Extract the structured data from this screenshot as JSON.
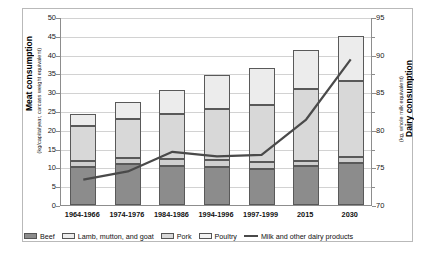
{
  "axes": {
    "left": {
      "title": "Meat consumption",
      "subtitle": "(kg/capita/year, carcass weight equivalent)",
      "ticks": [
        "0",
        "5",
        "10",
        "15",
        "20",
        "25",
        "30",
        "35",
        "40",
        "45",
        "50"
      ],
      "min": 0,
      "max": 50
    },
    "right": {
      "title": "Dairy consumption",
      "subtitle": "(kg, whole milk equivalent)",
      "ticks": [
        "70",
        "75",
        "80",
        "85",
        "90",
        "95"
      ],
      "min": 70,
      "max": 95
    }
  },
  "legend": {
    "items": [
      {
        "label": "Beef",
        "key": "beef",
        "marker": "swatch"
      },
      {
        "label": "Lamb, mutton, and goat",
        "key": "lamb",
        "marker": "swatch"
      },
      {
        "label": "Pork",
        "key": "pork",
        "marker": "swatch"
      },
      {
        "label": "Poultry",
        "key": "poultry",
        "marker": "swatch"
      },
      {
        "label": "Milk and other dairy products",
        "key": "milk",
        "marker": "line"
      }
    ]
  },
  "chart_data": {
    "type": "bar",
    "title": "",
    "xlabel": "",
    "ylabel": "Meat consumption (kg/capita/year, carcass weight equivalent)",
    "y2label": "Dairy consumption (kg, whole milk equivalent)",
    "ylim": [
      0,
      50
    ],
    "y2lim": [
      70,
      95
    ],
    "grid": true,
    "legend_position": "bottom",
    "stacked": true,
    "categories": [
      "1964-1966",
      "1974-1976",
      "1984-1986",
      "1994-1996",
      "1997-1999",
      "2015",
      "2030"
    ],
    "series": [
      {
        "name": "Beef",
        "axis": "left",
        "type": "bar",
        "values": [
          10.2,
          11.0,
          10.5,
          10.0,
          9.7,
          10.3,
          11.2
        ]
      },
      {
        "name": "Poultry",
        "axis": "left",
        "type": "bar",
        "values": [
          1.6,
          1.6,
          1.7,
          2.0,
          1.8,
          1.5,
          1.6
        ]
      },
      {
        "name": "Pork",
        "axis": "left",
        "type": "bar",
        "values": [
          9.2,
          10.2,
          12.1,
          13.5,
          15.0,
          19.0,
          20.2
        ]
      },
      {
        "name": "Lamb, mutton, and goat",
        "axis": "left",
        "type": "bar",
        "values": [
          3.2,
          4.7,
          6.2,
          9.2,
          10.0,
          10.5,
          12.0
        ]
      },
      {
        "name": "Milk and other dairy products",
        "axis": "right",
        "type": "line",
        "values": [
          73.5,
          74.6,
          77.2,
          76.6,
          76.8,
          81.5,
          89.5
        ]
      }
    ],
    "totals": [
      24.2,
      27.5,
      30.5,
      34.7,
      36.5,
      41.3,
      45.0
    ]
  },
  "colors": {
    "beef": "#8c8c8c",
    "poultry": "#cfcfcf",
    "pork": "#d8d8d8",
    "lamb": "#ececec",
    "line": "#4a4a4a",
    "grid": "#d2d2d2",
    "axis": "#8d8d8d"
  }
}
